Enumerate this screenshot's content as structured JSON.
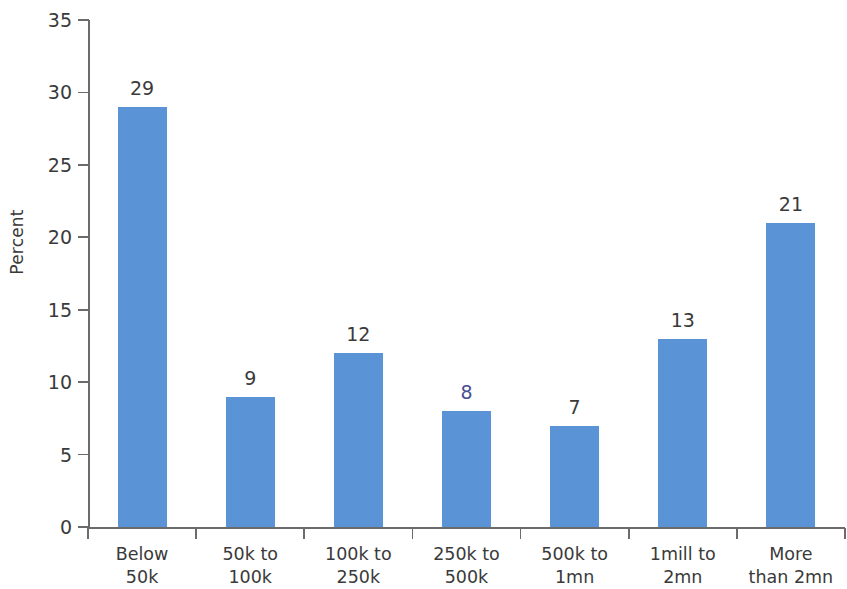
{
  "chart_data": {
    "type": "bar",
    "title": "",
    "xlabel": "",
    "ylabel": "Percent",
    "ylim": [
      0,
      35
    ],
    "ytick_step": 5,
    "yticks": [
      "35",
      "30",
      "25",
      "20",
      "15",
      "10",
      "5",
      "0"
    ],
    "grid": false,
    "legend": false,
    "bar_color": "#5b94d6",
    "categories": [
      "Below\n50k",
      "50k to\n100k",
      "100k to\n250k",
      "250k to\n500k",
      "500k to\n1mn",
      "1mill to\n2mn",
      "More\nthan 2mn"
    ],
    "values": [
      29,
      9,
      12,
      8,
      7,
      13,
      21
    ],
    "value_labels": [
      "29",
      "9",
      "12",
      "8",
      "7",
      "13",
      "21"
    ]
  }
}
